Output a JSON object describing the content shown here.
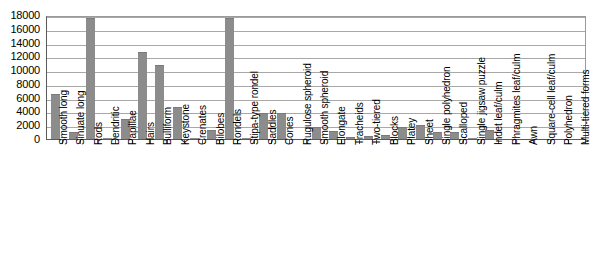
{
  "chart_data": {
    "type": "bar",
    "title": "",
    "subtitle": "",
    "xlabel": "",
    "ylabel": "",
    "ylim": [
      0,
      18000
    ],
    "ytick_step": 2000,
    "yticks": [
      "18000",
      "16000",
      "14000",
      "12000",
      "10000",
      "8000",
      "6000",
      "4000",
      "2000",
      "0"
    ],
    "grid": true,
    "legend": null,
    "bar_color": "#8c8c8c",
    "categories": [
      "Smooth long",
      "Sinuate long",
      "Rods",
      "Dendritic",
      "Papillae",
      "Hairs",
      "Bulliform",
      "Keystone",
      "Crenates",
      "Bilobes",
      "Rondels",
      "Stipa-type rondel",
      "Saddles",
      "Cones",
      "Rugulose spheroid",
      "Smooth spheroid",
      "Elongate",
      "Tracheids",
      "Two-tiered",
      "Blocks",
      "Platey",
      "Sheet",
      "Single polyhedron",
      "Scalloped",
      "Single jigsaw puzzle",
      "Indet leaf/culm",
      "Phragmites leaf/culm",
      "Awn",
      "Square-cell leaf/culm",
      "Polyhedron",
      "Multi-tiered forms"
    ],
    "values": [
      6600,
      1000,
      17600,
      150,
      2900,
      12700,
      10800,
      4600,
      200,
      1300,
      17600,
      100,
      3800,
      3800,
      0,
      1800,
      1200,
      300,
      500,
      600,
      1800,
      2000,
      1000,
      1000,
      100,
      1300,
      0,
      0,
      0,
      0,
      0
    ]
  }
}
